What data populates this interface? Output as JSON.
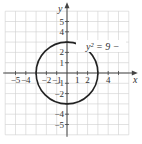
{
  "figure": {
    "equation_label": "y² = 9 − x²",
    "equation_visible": "y² = 9 −",
    "x_axis_label": "x",
    "y_axis_label": "y",
    "x_tick_labels": [
      {
        "v": -5,
        "t": "−5"
      },
      {
        "v": -4,
        "t": "−4"
      },
      {
        "v": -2,
        "t": "−2"
      },
      {
        "v": -1,
        "t": "−1"
      },
      {
        "v": 1,
        "t": "1"
      },
      {
        "v": 2,
        "t": "2"
      },
      {
        "v": 4,
        "t": "4"
      }
    ],
    "y_tick_labels": [
      {
        "v": 5,
        "t": "5"
      },
      {
        "v": 4,
        "t": "4"
      },
      {
        "v": 2,
        "t": "2"
      },
      {
        "v": 1,
        "t": "1"
      },
      {
        "v": -1,
        "t": "−1"
      },
      {
        "v": -2,
        "t": "−2"
      },
      {
        "v": -4,
        "t": "−4"
      },
      {
        "v": -5,
        "t": "−5"
      }
    ],
    "circle": {
      "cx": 0,
      "cy": 0,
      "r": 3
    },
    "grid_range": [
      -6,
      6
    ],
    "colors": {
      "grid": "#cfcfcf",
      "axis": "#444444",
      "curve": "#222222"
    }
  }
}
